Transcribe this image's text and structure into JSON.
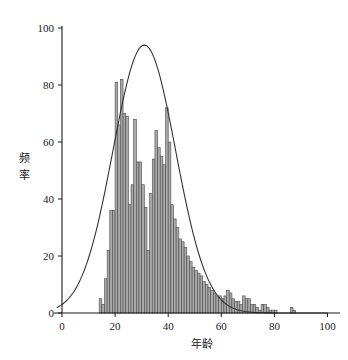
{
  "chart_data": {
    "type": "bar",
    "title": "",
    "subtitle": "",
    "xlabel": "年龄",
    "ylabel": "频率",
    "xlim": [
      -3,
      103
    ],
    "ylim": [
      0,
      104
    ],
    "xticks": [
      0,
      20,
      40,
      60,
      80,
      100
    ],
    "yticks": [
      0,
      20,
      40,
      60,
      80,
      100
    ],
    "xtick_labels": [
      "0",
      "20",
      "40",
      "60",
      "80",
      "100"
    ],
    "ytick_labels": [
      "0",
      "20",
      "40",
      "60",
      "80",
      "100"
    ],
    "grid": false,
    "legend": null,
    "bar_fill_color": "#a9a9a9",
    "bar_edge_color": "#4a4a4a",
    "curve_color": "#333333",
    "axis_color": "#1a1a1a",
    "bin_width": 1,
    "categories": [
      14,
      15,
      16,
      17,
      18,
      19,
      20,
      21,
      22,
      23,
      24,
      25,
      26,
      27,
      28,
      29,
      30,
      31,
      32,
      33,
      34,
      35,
      36,
      37,
      38,
      39,
      40,
      41,
      42,
      43,
      44,
      45,
      46,
      47,
      48,
      49,
      50,
      51,
      52,
      53,
      54,
      55,
      56,
      57,
      58,
      59,
      60,
      61,
      62,
      63,
      64,
      65,
      66,
      67,
      68,
      69,
      70,
      71,
      72,
      73,
      74,
      75,
      76,
      77,
      78,
      79,
      80,
      81,
      82,
      83,
      84,
      85,
      86,
      87
    ],
    "values": [
      5,
      3,
      12,
      22,
      36,
      36,
      81,
      66,
      82,
      70,
      69,
      38,
      45,
      68,
      53,
      53,
      45,
      37,
      22,
      42,
      54,
      64,
      58,
      55,
      52,
      72,
      60,
      38,
      33,
      30,
      26,
      25,
      23,
      20,
      18,
      16,
      15,
      14,
      13,
      11,
      10,
      9,
      8,
      7,
      6,
      6,
      5,
      6,
      8,
      7,
      5,
      4,
      4,
      3,
      6,
      5,
      5,
      3,
      3,
      2,
      1,
      3,
      3,
      2,
      1,
      1,
      1,
      0,
      0,
      0,
      0,
      0,
      2,
      1
    ],
    "overlay_curve": {
      "name": "normal-fit",
      "type": "line",
      "mean": 31,
      "std": 11.8,
      "peak_value": 94,
      "peak_x": 31
    }
  },
  "figure": {
    "width": 348,
    "height": 360
  }
}
